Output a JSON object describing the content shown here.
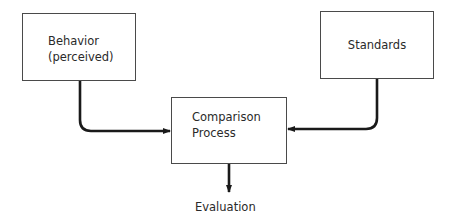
{
  "diagram": {
    "type": "flowchart",
    "nodes": {
      "behavior": {
        "line1": "Behavior",
        "line2": "(perceived)"
      },
      "standards": {
        "line1": "Standards"
      },
      "comparison": {
        "line1": "Comparison",
        "line2": "Process"
      },
      "evaluation": {
        "label": "Evaluation"
      }
    },
    "edges": [
      {
        "from": "Behavior (perceived)",
        "to": "Comparison Process"
      },
      {
        "from": "Standards",
        "to": "Comparison Process"
      },
      {
        "from": "Comparison Process",
        "to": "Evaluation"
      }
    ],
    "colors": {
      "stroke": "#1a1a1a",
      "box_border": "#4a4a4a",
      "background": "#ffffff"
    }
  }
}
